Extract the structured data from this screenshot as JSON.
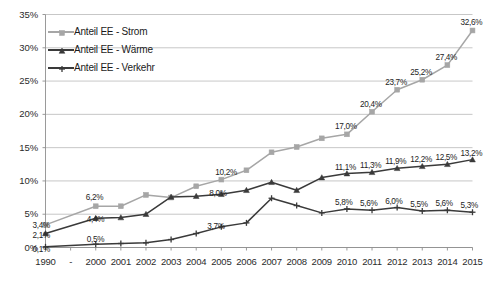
{
  "chart_data": {
    "type": "line",
    "title": "",
    "subtitle": "",
    "xlabel": "",
    "ylabel": "",
    "grid": true,
    "legend_position": "top-left",
    "ylim": [
      0,
      35
    ],
    "ytick_labels": [
      "0%",
      "5%",
      "10%",
      "15%",
      "20%",
      "25%",
      "30%",
      "35%"
    ],
    "ytick_values": [
      0,
      5,
      10,
      15,
      20,
      25,
      30,
      35
    ],
    "categories": [
      "1990",
      "-",
      "2000",
      "2001",
      "2002",
      "2003",
      "2004",
      "2005",
      "2006",
      "2007",
      "2008",
      "2009",
      "2010",
      "2011",
      "2012",
      "2013",
      "2014",
      "2015"
    ],
    "series": [
      {
        "name": "Anteil EE - Strom",
        "color": "#a6a6a6",
        "marker": "square",
        "values": [
          3.4,
          null,
          6.2,
          6.2,
          7.9,
          7.5,
          9.2,
          10.2,
          11.6,
          14.3,
          15.1,
          16.4,
          17.0,
          20.4,
          23.7,
          25.2,
          27.4,
          32.6
        ],
        "labels": [
          "3,4%",
          "",
          "6,2%",
          "",
          "",
          "",
          "",
          "10,2%",
          "",
          "",
          "",
          "",
          "17,0%",
          "20,4%",
          "23,7%",
          "25,2%",
          "27,4%",
          "32,6%"
        ]
      },
      {
        "name": "Anteil EE - Wärme",
        "color": "#3a3a3a",
        "marker": "triangle",
        "values": [
          2.1,
          null,
          4.4,
          4.5,
          5.0,
          7.6,
          7.7,
          8.0,
          8.6,
          9.8,
          8.6,
          10.5,
          11.1,
          11.3,
          11.9,
          12.2,
          12.5,
          13.2
        ],
        "labels": [
          "2,1%",
          "",
          "4,4%",
          "",
          "",
          "",
          "",
          "8,0%",
          "",
          "",
          "",
          "",
          "11,1%",
          "11,3%",
          "11,9%",
          "12,2%",
          "12,5%",
          "13,2%"
        ]
      },
      {
        "name": "Anteil EE - Verkehr",
        "color": "#3a3a3a",
        "marker": "plus",
        "values": [
          0.1,
          null,
          0.5,
          0.6,
          0.7,
          1.2,
          2.1,
          3.1,
          3.7,
          7.4,
          6.3,
          5.2,
          5.8,
          5.6,
          6.0,
          5.5,
          5.6,
          5.3
        ],
        "labels": [
          "0,1%",
          "",
          "0,5%",
          "",
          "",
          "",
          "",
          "3,7%",
          "",
          "",
          "",
          "",
          "5,8%",
          "5,6%",
          "6,0%",
          "5,5%",
          "5,6%",
          "5,3%"
        ]
      }
    ]
  }
}
